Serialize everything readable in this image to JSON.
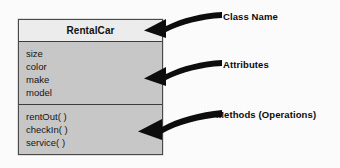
{
  "diagram": {
    "class_box": {
      "name": "RentalCar",
      "attributes": [
        "size",
        "color",
        "make",
        "model"
      ],
      "methods": [
        "rentOut( )",
        "checkIn( )",
        "service( )"
      ]
    },
    "annotations": [
      {
        "label": "Class Name",
        "icon": "curved-arrow-left-icon"
      },
      {
        "label": "Attributes",
        "icon": "curved-arrow-left-icon"
      },
      {
        "label": "Methods (Operations)",
        "icon": "curved-arrow-left-icon"
      }
    ],
    "colors": {
      "box_fill": "#c9c9c9",
      "name_fill": "#eeeeee",
      "border": "#3d3d3d",
      "arrow": "#0d0d0d",
      "text": "#111111",
      "background": "#fdfdfd"
    }
  }
}
